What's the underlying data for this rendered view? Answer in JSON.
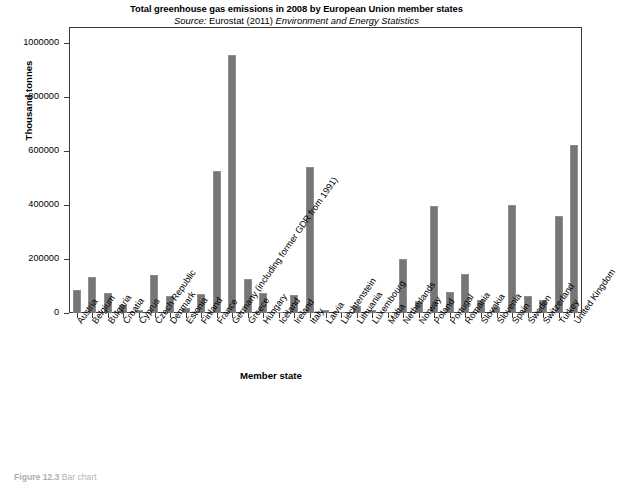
{
  "figure": {
    "title": "Total greenhouse gas emissions in 2008 by European Union member states",
    "source_prefix": "Source:",
    "source_org": "Eurostat (2011)",
    "source_pub": "Environment and Energy Statistics",
    "caption_number": "Figure 12.3",
    "caption_text": "Bar chart",
    "bar_color": "#767676",
    "axis_color": "#3b3b3b"
  },
  "chart_data": {
    "type": "bar",
    "title": "Total greenhouse gas emissions in 2008 by European Union member states",
    "subtitle": "Source: Eurostat (2011) Environment and Energy Statistics",
    "xlabel": "Member state",
    "ylabel": "Thousand tonnes",
    "ylim": [
      0,
      1060000
    ],
    "yticks": [
      0,
      200000,
      400000,
      600000,
      800000,
      1000000
    ],
    "ytick_labels": [
      "0",
      "200000",
      "400000",
      "600000",
      "800000",
      "1000000"
    ],
    "grid": false,
    "legend": null,
    "categories": [
      "Austria",
      "Belgium",
      "Bulgaria",
      "Croatia",
      "Cyprus",
      "Czech Republic",
      "Denmark",
      "Estonia",
      "Finland",
      "France",
      "Germany (including former GDR from 1991)",
      "Greece",
      "Hungary",
      "Iceland",
      "Ireland",
      "Italy",
      "Latvia",
      "Liechtenstein",
      "Lithuania",
      "Luxembourg",
      "Malta",
      "Netherlands",
      "Norway",
      "Poland",
      "Portugal",
      "Romania",
      "Slovakia",
      "Slovenia",
      "Spain",
      "Sweden",
      "Switzerland",
      "Turkey",
      "United Kingdom"
    ],
    "values": [
      86000,
      133000,
      73000,
      31000,
      10000,
      141000,
      64000,
      20000,
      70000,
      527000,
      958000,
      126000,
      73000,
      5000,
      68000,
      541000,
      12000,
      1000,
      25000,
      12000,
      3000,
      200000,
      46000,
      395000,
      78000,
      145000,
      49000,
      21000,
      401000,
      62000,
      50000,
      361000,
      622000
    ]
  }
}
